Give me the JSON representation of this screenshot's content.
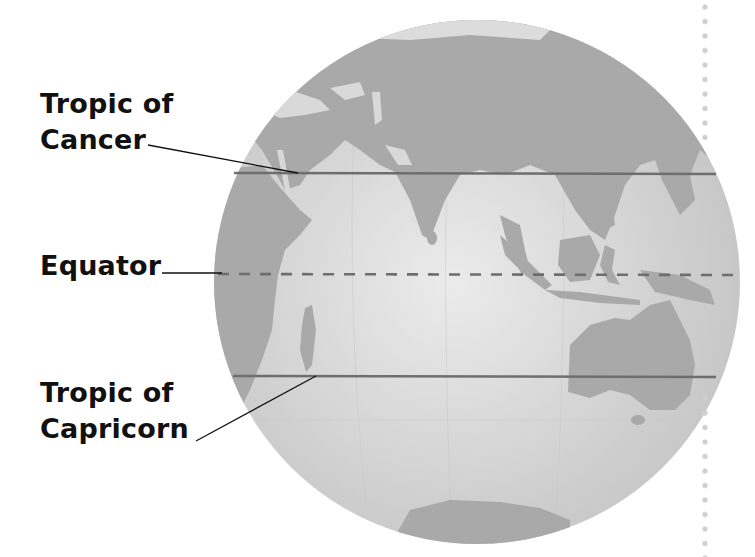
{
  "figure": {
    "type": "globe-latitude-diagram",
    "view": "Eastern Hemisphere centered on Indian Ocean",
    "colors": {
      "background": "#ffffff",
      "ocean": "#d4d4d4",
      "ocean_highlight": "#e6e6e6",
      "land": "#a9a9a9",
      "lines": "#6b6b6b",
      "leader": "#111111",
      "dots": "#cfcfcf"
    }
  },
  "labels": {
    "cancer": {
      "line1": "Tropic of",
      "line2": "Cancer"
    },
    "equator": {
      "text": "Equator"
    },
    "capricorn": {
      "line1": "Tropic of",
      "line2": "Capricorn"
    }
  },
  "lines": [
    {
      "name": "Tropic of Cancer",
      "style": "solid",
      "y": 173
    },
    {
      "name": "Equator",
      "style": "dashed",
      "y": 274
    },
    {
      "name": "Tropic of Capricorn",
      "style": "solid",
      "y": 376
    }
  ]
}
